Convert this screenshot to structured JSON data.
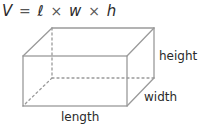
{
  "formula": {
    "lhs": "V",
    "equals": "=",
    "terms": [
      "ℓ",
      "w",
      "h"
    ],
    "operator": "×"
  },
  "labels": {
    "height": "height",
    "width": "width",
    "length": "length"
  },
  "colors": {
    "edge": "#9a9a9a",
    "text": "#2a2a2a",
    "background": "#ffffff"
  }
}
